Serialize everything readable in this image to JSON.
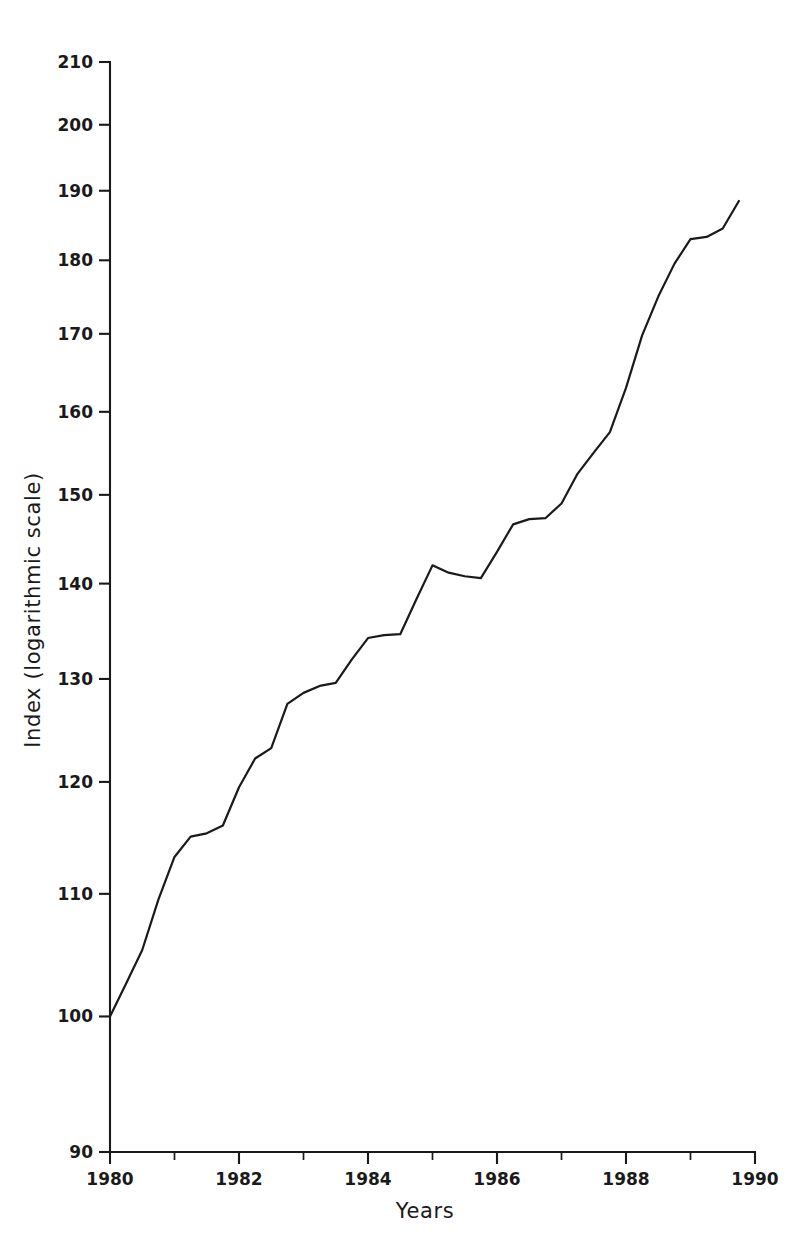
{
  "chart_data": {
    "type": "line",
    "title": "",
    "subtitle": "",
    "xlabel": "Years",
    "ylabel": "Index (logarithmic scale)",
    "scale": {
      "x": "linear",
      "y": "log"
    },
    "grid": false,
    "legend": null,
    "legend_position": "none",
    "xlim": [
      1980,
      1990
    ],
    "ylim": [
      90,
      210
    ],
    "x_major_ticks": [
      1980,
      1982,
      1984,
      1986,
      1988,
      1990
    ],
    "x_major_tick_labels": [
      "1980",
      "1982",
      "1984",
      "1986",
      "1988",
      "1990"
    ],
    "x_minor_ticks": [
      1981,
      1983,
      1985,
      1987,
      1989
    ],
    "y_major_ticks": [
      90,
      100,
      110,
      120,
      130,
      140,
      150,
      160,
      170,
      180,
      190,
      200,
      210
    ],
    "y_major_tick_labels": [
      "90",
      "100",
      "110",
      "120",
      "130",
      "140",
      "150",
      "160",
      "170",
      "180",
      "190",
      "200",
      "210"
    ],
    "y_labelled_ticks": [
      90,
      100,
      110,
      120,
      130,
      140,
      150,
      160,
      170,
      180,
      190,
      200,
      210
    ],
    "series": [
      {
        "name": "Index",
        "color": "#1a1a1a",
        "x": [
          1980.0,
          1980.25,
          1980.5,
          1980.75,
          1981.0,
          1981.25,
          1981.5,
          1981.75,
          1982.0,
          1982.25,
          1982.5,
          1982.75,
          1983.0,
          1983.25,
          1983.5,
          1983.75,
          1984.0,
          1984.25,
          1984.5,
          1984.75,
          1985.0,
          1985.25,
          1985.5,
          1985.75,
          1986.0,
          1986.25,
          1986.5,
          1986.75,
          1987.0,
          1987.25,
          1987.5,
          1987.75,
          1988.0,
          1988.25,
          1988.5,
          1988.75,
          1989.0,
          1989.25,
          1989.5,
          1989.75
        ],
        "values": [
          100.0,
          102.6,
          105.3,
          109.5,
          113.2,
          115.0,
          115.3,
          116.0,
          119.5,
          122.2,
          123.2,
          127.5,
          128.6,
          129.3,
          129.6,
          132.0,
          134.2,
          134.5,
          134.6,
          138.3,
          142.0,
          141.2,
          140.8,
          140.6,
          143.5,
          146.6,
          147.2,
          147.3,
          149.0,
          152.5,
          155.0,
          157.5,
          163.0,
          169.8,
          175.0,
          179.5,
          183.0,
          183.3,
          184.5,
          188.5
        ]
      }
    ]
  }
}
